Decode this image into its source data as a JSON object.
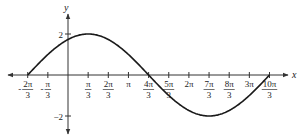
{
  "chart_data": {
    "type": "line",
    "title": "",
    "xlabel": "x",
    "ylabel": "y",
    "function": "y = 2 sin(x/2 + π/3)",
    "amplitude": 2,
    "period_in_pi": 4,
    "x_ticks": [
      {
        "value_pi_over_3": -2,
        "num": "2π",
        "den": "3",
        "sign": "-"
      },
      {
        "value_pi_over_3": -1,
        "num": "π",
        "den": "3",
        "sign": "-"
      },
      {
        "value_pi_over_3": 1,
        "num": "π",
        "den": "3",
        "sign": ""
      },
      {
        "value_pi_over_3": 2,
        "num": "2π",
        "den": "3",
        "sign": ""
      },
      {
        "value_pi_over_3": 3,
        "text": "π"
      },
      {
        "value_pi_over_3": 4,
        "num": "4π",
        "den": "3",
        "sign": ""
      },
      {
        "value_pi_over_3": 5,
        "num": "5π",
        "den": "3",
        "sign": ""
      },
      {
        "value_pi_over_3": 6,
        "text": "2π"
      },
      {
        "value_pi_over_3": 7,
        "num": "7π",
        "den": "3",
        "sign": ""
      },
      {
        "value_pi_over_3": 8,
        "num": "8π",
        "den": "3",
        "sign": ""
      },
      {
        "value_pi_over_3": 9,
        "text": "3π"
      },
      {
        "value_pi_over_3": 10,
        "num": "10π",
        "den": "3",
        "sign": ""
      }
    ],
    "y_ticks": [
      {
        "value": 2,
        "text": "2"
      },
      {
        "value": -2,
        "text": "−2"
      }
    ],
    "key_points": [
      {
        "x": "-2π/3",
        "y": 0
      },
      {
        "x": "π/3",
        "y": 2
      },
      {
        "x": "4π/3",
        "y": 0
      },
      {
        "x": "7π/3",
        "y": -2
      },
      {
        "x": "10π/3",
        "y": 0
      }
    ],
    "x_range_pi_over_3": [
      -2,
      10
    ],
    "ylim": [
      -2,
      2
    ],
    "grid": false,
    "legend": null
  },
  "colors": {
    "curve": "#1a1a1a",
    "axis": "#333333"
  }
}
